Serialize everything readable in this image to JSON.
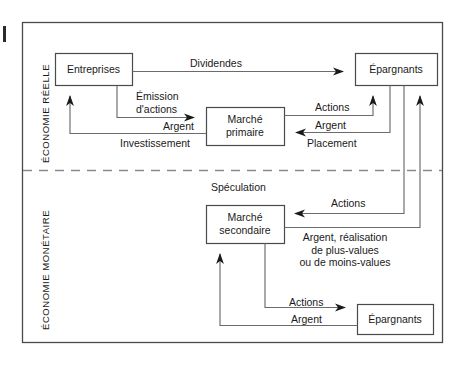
{
  "figure": {
    "background_color": "#ffffff",
    "line_color": "#555555",
    "text_color": "#1a1a1a",
    "frame": {
      "x": 22,
      "y": 22,
      "width": 421,
      "height": 321
    },
    "divider_y": 170
  },
  "bands": [
    {
      "name": "band-economie-reelle",
      "label": "ÉCONOMIE RÉELLE"
    },
    {
      "name": "band-economie-monetaire",
      "label": "ÉCONOMIE MONÉTAIRE"
    }
  ],
  "nodes": [
    {
      "id": "entreprises",
      "label": "Entreprises",
      "lines": [
        "Entreprises"
      ],
      "x": 55,
      "y": 53,
      "width": 77,
      "height": 32
    },
    {
      "id": "epargnants-haut",
      "label": "Épargnants",
      "lines": [
        "Épargnants"
      ],
      "x": 355,
      "y": 53,
      "width": 82,
      "height": 32
    },
    {
      "id": "marche-primaire",
      "label": "Marché primaire",
      "lines": [
        "Marché",
        "primaire"
      ],
      "x": 206,
      "y": 107,
      "width": 78,
      "height": 38
    },
    {
      "id": "marche-secondaire",
      "label": "Marché secondaire",
      "lines": [
        "Marché",
        "secondaire"
      ],
      "x": 206,
      "y": 205,
      "width": 78,
      "height": 38
    },
    {
      "id": "epargnants-bas",
      "label": "Épargnants",
      "lines": [
        "Épargnants"
      ],
      "x": 357,
      "y": 304,
      "width": 76,
      "height": 30
    }
  ],
  "edge_labels": [
    {
      "id": "dividendes",
      "text": "Dividendes",
      "lines": [
        "Dividendes"
      ],
      "x": 216,
      "y": 57,
      "align": "center"
    },
    {
      "id": "emission-actions",
      "text": "Émission d'actions",
      "lines": [
        "Émission",
        "d'actions"
      ],
      "x": 136,
      "y": 90,
      "align": "left"
    },
    {
      "id": "argent-investissement",
      "text": "Argent",
      "lines": [
        "Argent"
      ],
      "x": 163,
      "y": 119,
      "align": "left"
    },
    {
      "id": "investissement",
      "text": "Investissement",
      "lines": [
        "Investissement"
      ],
      "x": 120,
      "y": 136,
      "align": "left"
    },
    {
      "id": "actions-primaire",
      "text": "Actions",
      "lines": [
        "Actions"
      ],
      "x": 313,
      "y": 100,
      "align": "left"
    },
    {
      "id": "argent-placement",
      "text": "Argent",
      "lines": [
        "Argent"
      ],
      "x": 313,
      "y": 119,
      "align": "left"
    },
    {
      "id": "placement",
      "text": "Placement",
      "lines": [
        "Placement"
      ],
      "x": 305,
      "y": 136,
      "align": "left"
    },
    {
      "id": "speculation",
      "text": "Spéculation",
      "lines": [
        "Spéculation"
      ],
      "x": 210,
      "y": 181,
      "align": "left"
    },
    {
      "id": "actions-secondaire",
      "text": "Actions",
      "lines": [
        "Actions"
      ],
      "x": 330,
      "y": 197,
      "align": "left"
    },
    {
      "id": "argent-realisation",
      "text": "Argent, réalisation de plus-values ou de moins-values",
      "lines": [
        "Argent, réalisation",
        "de plus-values",
        "ou de moins-values"
      ],
      "x": 300,
      "y": 230,
      "align": "center"
    },
    {
      "id": "actions-bas",
      "text": "Actions",
      "lines": [
        "Actions"
      ],
      "x": 288,
      "y": 296,
      "align": "left"
    },
    {
      "id": "argent-bas",
      "text": "Argent",
      "lines": [
        "Argent"
      ],
      "x": 290,
      "y": 313,
      "align": "left"
    }
  ]
}
